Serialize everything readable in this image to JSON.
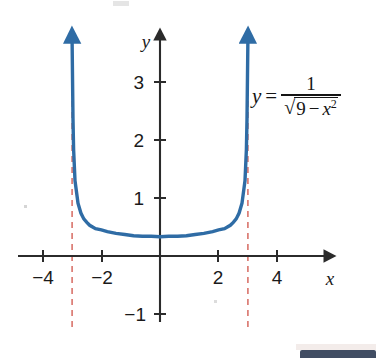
{
  "figure": {
    "name": "graph-of-y-equals-one-over-sqrt-nine-minus-x-squared",
    "background_color": "#ffffff"
  },
  "equation": {
    "lhs": "y",
    "equals": "=",
    "numerator": "1",
    "radical_sign": "√",
    "radicand_first": "9",
    "radicand_minus": "−",
    "radicand_var": "x",
    "radicand_exponent": "2",
    "plain_text": "y = 1/√(9 − x²)"
  },
  "axes": {
    "x_label": "x",
    "y_label": "y",
    "x_ticks": [
      {
        "value": -4,
        "label": "−4"
      },
      {
        "value": -2,
        "label": "−2"
      },
      {
        "value": 2,
        "label": "2"
      },
      {
        "value": 4,
        "label": "4"
      }
    ],
    "y_ticks": [
      {
        "value": 3,
        "label": "3"
      },
      {
        "value": 2,
        "label": "2"
      },
      {
        "value": 1,
        "label": "1"
      },
      {
        "value": -1,
        "label": "−1"
      }
    ],
    "axis_color": "#2b2b2b"
  },
  "chart_data": {
    "type": "line",
    "title": "",
    "subtitle": "",
    "xlabel": "x",
    "ylabel": "y",
    "xlim": [
      -4.85,
      5.85
    ],
    "ylim": [
      -1.4,
      3.9
    ],
    "grid": false,
    "legend": null,
    "annotations": [
      {
        "name": "equation-label",
        "text": "y = 1/√(9 − x²)",
        "x": 3.2,
        "y": 2.45
      }
    ],
    "asymptotes": [
      {
        "name": "left-vertical-asymptote",
        "type": "vertical",
        "x": -3,
        "style": "dashed",
        "color": "#d9736b"
      },
      {
        "name": "right-vertical-asymptote",
        "type": "vertical",
        "x": 3,
        "style": "dashed",
        "color": "#d9736b"
      }
    ],
    "series": [
      {
        "name": "y = 1/sqrt(9 - x^2)",
        "color": "#2f6ca5",
        "minimum": {
          "x": 0,
          "y": 0.333
        },
        "domain": [
          -3,
          3
        ],
        "x": [
          -2.97,
          -2.95,
          -2.9,
          -2.8,
          -2.7,
          -2.6,
          -2.5,
          -2.4,
          -2.2,
          -2.0,
          -1.8,
          -1.5,
          -1.2,
          -0.9,
          -0.6,
          -0.3,
          0,
          0.3,
          0.6,
          0.9,
          1.2,
          1.5,
          1.8,
          2.0,
          2.2,
          2.4,
          2.5,
          2.6,
          2.7,
          2.8,
          2.9,
          2.95,
          2.97
        ],
        "y": [
          2.36,
          1.84,
          1.3,
          0.91,
          0.74,
          0.64,
          0.58,
          0.53,
          0.47,
          0.45,
          0.42,
          0.39,
          0.37,
          0.35,
          0.34,
          0.34,
          0.333,
          0.34,
          0.34,
          0.35,
          0.37,
          0.39,
          0.42,
          0.45,
          0.47,
          0.53,
          0.58,
          0.64,
          0.74,
          0.91,
          1.3,
          1.84,
          2.36
        ]
      }
    ]
  }
}
